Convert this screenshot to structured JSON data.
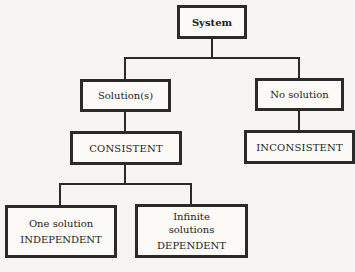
{
  "diagram": {
    "type": "tree",
    "nodes": {
      "system": {
        "label": "System"
      },
      "solutions": {
        "label": "Solution(s)"
      },
      "no_solution": {
        "label": "No solution"
      },
      "consistent": {
        "label": "CONSISTENT"
      },
      "inconsistent": {
        "label": "INCONSISTENT"
      },
      "one_solution": {
        "line1": "One solution",
        "line2": "INDEPENDENT"
      },
      "infinite": {
        "line1": "Infinite",
        "line2": "solutions",
        "line3": "DEPENDENT"
      }
    },
    "edges": [
      [
        "System",
        "Solution(s)"
      ],
      [
        "System",
        "No solution"
      ],
      [
        "Solution(s)",
        "CONSISTENT"
      ],
      [
        "No solution",
        "INCONSISTENT"
      ],
      [
        "CONSISTENT",
        "One solution INDEPENDENT"
      ],
      [
        "CONSISTENT",
        "Infinite solutions DEPENDENT"
      ]
    ],
    "colors": {
      "line": "#2a2a2a",
      "background": "#f6f5f1"
    }
  }
}
